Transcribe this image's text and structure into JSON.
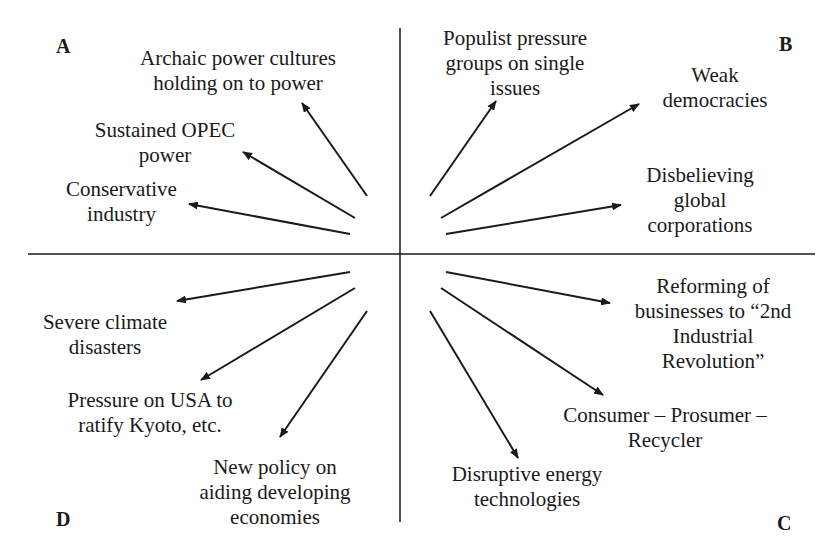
{
  "quadrants": {
    "A": "A",
    "B": "B",
    "C": "C",
    "D": "D"
  },
  "labels": {
    "archaic": "Archaic power cultures\nholding on to power",
    "opec": "Sustained OPEC\npower",
    "conservative": "Conservative\nindustry",
    "populist": "Populist pressure\ngroups on single\nissues",
    "weak": "Weak\ndemocracies",
    "disbelieving": "Disbelieving\nglobal\ncorporations",
    "severe": "Severe climate\ndisasters",
    "pressure_usa": "Pressure on USA to\nratify Kyoto, etc.",
    "new_policy": "New policy on\naiding developing\neconomies",
    "reforming": "Reforming of\nbusinesses to “2nd\nIndustrial\nRevolution”",
    "consumer": "Consumer – Prosumer –\nRecycler",
    "disruptive": "Disruptive energy\ntechnologies"
  },
  "colors": {
    "line": "#1a1a1a",
    "background": "#ffffff"
  }
}
